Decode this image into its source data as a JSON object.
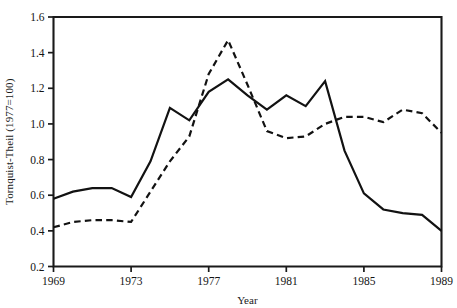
{
  "chart_data": {
    "type": "line",
    "title": "",
    "xlabel": "Year",
    "ylabel": "Tornquist-Theil (1977=100)",
    "xlim": [
      1969,
      1989
    ],
    "ylim": [
      0.2,
      1.6
    ],
    "grid": false,
    "legend": "none",
    "xticks": [
      "1969",
      "1973",
      "1977",
      "1981",
      "1985",
      "1989"
    ],
    "xtick_values": [
      1969,
      1973,
      1977,
      1981,
      1985,
      1989
    ],
    "yticks": [
      "0.2",
      "0.4",
      "0.6",
      "0.8",
      "1.0",
      "1.2",
      "1.4",
      "1.6"
    ],
    "ytick_values": [
      0.2,
      0.4,
      0.6,
      0.8,
      1.0,
      1.2,
      1.4,
      1.6
    ],
    "x": [
      1969,
      1970,
      1971,
      1972,
      1973,
      1974,
      1975,
      1976,
      1977,
      1978,
      1979,
      1980,
      1981,
      1982,
      1983,
      1984,
      1985,
      1986,
      1987,
      1988,
      1989
    ],
    "series": [
      {
        "name": "solid-series",
        "style": "solid",
        "color": "#121212",
        "values": [
          0.58,
          0.62,
          0.64,
          0.64,
          0.59,
          0.79,
          1.09,
          1.02,
          1.18,
          1.25,
          1.16,
          1.08,
          1.16,
          1.1,
          1.24,
          0.85,
          0.61,
          0.52,
          0.5,
          0.49,
          0.4
        ]
      },
      {
        "name": "dashed-series",
        "style": "dashed",
        "color": "#121212",
        "values": [
          0.42,
          0.45,
          0.46,
          0.46,
          0.45,
          0.62,
          0.79,
          0.93,
          1.28,
          1.47,
          1.22,
          0.96,
          0.92,
          0.93,
          1.0,
          1.04,
          1.04,
          1.01,
          1.08,
          1.06,
          0.95
        ]
      }
    ]
  },
  "axes": {
    "x_axis_label": "Year",
    "y_axis_label": "Tornquist-Theil (1977=100)"
  }
}
